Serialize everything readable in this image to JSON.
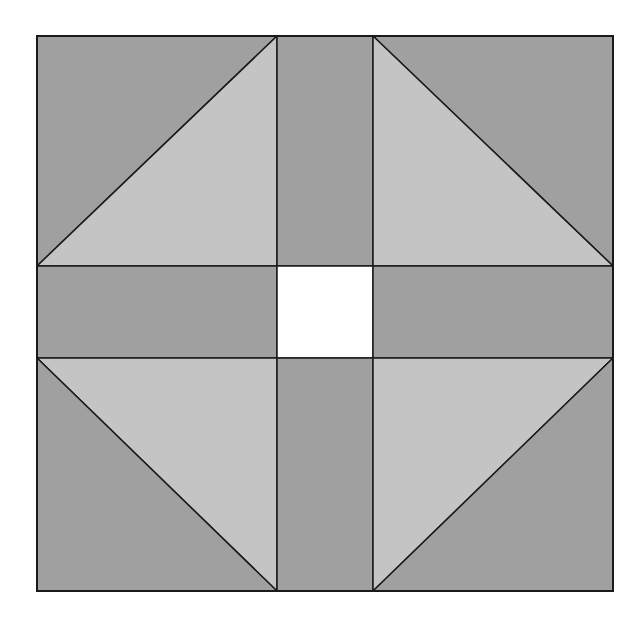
{
  "diagram": {
    "type": "quilt-block",
    "colors": {
      "background": "#ffffff",
      "dark": "#a0a0a0",
      "light": "#c4c4c4",
      "center": "#ffffff",
      "stroke": "#1a1a1a"
    },
    "bounds": {
      "x1": 37,
      "y1": 36,
      "x2": 613,
      "y2": 591
    },
    "grid": {
      "vx": [
        277,
        373
      ],
      "hy": [
        266,
        358
      ]
    },
    "pieces": [
      {
        "id": "top-left-dark",
        "fill": "dark",
        "points": "37,36 277,36 37,266"
      },
      {
        "id": "top-left-light",
        "fill": "light",
        "points": "277,36 277,266 37,266"
      },
      {
        "id": "top-middle",
        "fill": "dark",
        "points": "277,36 373,36 373,266 277,266"
      },
      {
        "id": "top-right-dark",
        "fill": "dark",
        "points": "373,36 613,36 613,266"
      },
      {
        "id": "top-right-light",
        "fill": "light",
        "points": "373,36 613,266 373,266"
      },
      {
        "id": "middle-left",
        "fill": "dark",
        "points": "37,266 277,266 277,358 37,358"
      },
      {
        "id": "center",
        "fill": "center",
        "points": "277,266 373,266 373,358 277,358"
      },
      {
        "id": "middle-right",
        "fill": "dark",
        "points": "373,266 613,266 613,358 373,358"
      },
      {
        "id": "bottom-left-light",
        "fill": "light",
        "points": "37,358 277,358 277,591"
      },
      {
        "id": "bottom-left-dark",
        "fill": "dark",
        "points": "37,358 277,591 37,591"
      },
      {
        "id": "bottom-middle",
        "fill": "dark",
        "points": "277,358 373,358 373,591 277,591"
      },
      {
        "id": "bottom-right-light",
        "fill": "light",
        "points": "373,358 613,358 373,591"
      },
      {
        "id": "bottom-right-dark",
        "fill": "dark",
        "points": "613,358 613,591 373,591"
      }
    ]
  }
}
